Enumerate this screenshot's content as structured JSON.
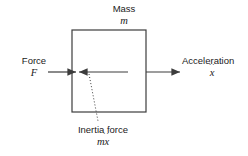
{
  "diagram": {
    "type": "free-body-diagram",
    "stroke_color": "#3c3c3c",
    "text_color": "#1a1a1a",
    "background_color": "#ffffff",
    "body": {
      "name": "mass-box",
      "label": "Mass",
      "symbol_base": "m",
      "symbol_full": "m",
      "x": 72,
      "y": 30,
      "width": 74,
      "height": 82
    },
    "arrows": [
      {
        "name": "force-arrow",
        "label": "Force",
        "symbol_base": "F",
        "symbol_overdots": "",
        "symbol_full": "F",
        "direction": "right",
        "from_x": 48,
        "to_x": 76,
        "y": 72
      },
      {
        "name": "acceleration-arrow",
        "label": "Acceleration",
        "symbol_base": "x",
        "symbol_overdots": "··",
        "symbol_full": "ẍ",
        "direction": "right",
        "from_x": 146,
        "to_x": 180,
        "y": 72
      },
      {
        "name": "inertia-force-arrow",
        "label": "Inertia force",
        "symbol_base": "mx",
        "symbol_overdots": "··",
        "symbol_full": "mẍ",
        "direction": "left",
        "from_x": 128,
        "to_x": 79,
        "y": 72
      }
    ],
    "leader_line": {
      "name": "inertia-leader-line",
      "style": "dotted",
      "from_x": 89,
      "from_y": 74,
      "to_x": 98,
      "to_y": 121
    }
  }
}
